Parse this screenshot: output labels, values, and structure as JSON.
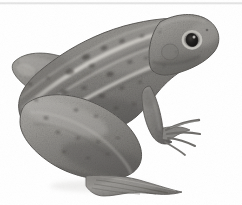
{
  "image": {
    "subject": "frog",
    "caption": "Grayscale photograph of a frog in right-facing profile on a plain white background",
    "orientation": "facing-right",
    "background_color": "#ffffff",
    "width": 242,
    "height": 205,
    "color_mode": "grayscale",
    "top_rule_color": "#c9c9c9"
  },
  "palette": {
    "skin_base": "#8f8d8a",
    "skin_light": "#b4b2ae",
    "skin_mid": "#7e7c79",
    "skin_dark": "#5f5d5a",
    "skin_shadow": "#4a4846",
    "ridge_stripe": "#c3c1bc",
    "spot_dark": "#3a3836",
    "eye_pupil": "#1b1a19",
    "eye_ring": "#cfcdc8",
    "outline": "#55534f",
    "webbing": "#9a9895",
    "highlight": "#d3d1cc"
  },
  "anatomy": {
    "parts": [
      {
        "name": "head",
        "label": "Head"
      },
      {
        "name": "snout",
        "label": "Snout"
      },
      {
        "name": "eye",
        "label": "Eye"
      },
      {
        "name": "tympanum",
        "label": "Tympanum (eardrum)"
      },
      {
        "name": "dorsolateral-ridge",
        "label": "Dorsolateral ridge"
      },
      {
        "name": "back",
        "label": "Back (dorsum)"
      },
      {
        "name": "flank",
        "label": "Flank"
      },
      {
        "name": "foreleg",
        "label": "Foreleg"
      },
      {
        "name": "front-foot",
        "label": "Front foot"
      },
      {
        "name": "thigh",
        "label": "Thigh"
      },
      {
        "name": "shank",
        "label": "Shank (tibia)"
      },
      {
        "name": "hind-foot",
        "label": "Webbed hind foot"
      }
    ]
  },
  "markings": {
    "stripe_count": 3,
    "spot_count": 34,
    "description": "Dark rounded spots scattered over the back and thighs with pale dorsolateral ridges"
  },
  "spots": [
    {
      "cx": 86,
      "cy": 57,
      "rx": 4.0,
      "ry": 2.6,
      "rot": -18,
      "op": 0.55
    },
    {
      "cx": 104,
      "cy": 48,
      "rx": 3.4,
      "ry": 2.2,
      "rot": -20,
      "op": 0.5
    },
    {
      "cx": 122,
      "cy": 41,
      "rx": 3.0,
      "ry": 2.0,
      "rot": -22,
      "op": 0.45
    },
    {
      "cx": 142,
      "cy": 36,
      "rx": 2.6,
      "ry": 1.8,
      "rot": -24,
      "op": 0.42
    },
    {
      "cx": 160,
      "cy": 32,
      "rx": 2.2,
      "ry": 1.5,
      "rot": -25,
      "op": 0.4
    },
    {
      "cx": 70,
      "cy": 72,
      "rx": 4.2,
      "ry": 2.8,
      "rot": -12,
      "op": 0.55
    },
    {
      "cx": 92,
      "cy": 66,
      "rx": 3.2,
      "ry": 2.2,
      "rot": -14,
      "op": 0.45
    },
    {
      "cx": 110,
      "cy": 74,
      "rx": 3.8,
      "ry": 2.5,
      "rot": -10,
      "op": 0.5
    },
    {
      "cx": 130,
      "cy": 62,
      "rx": 2.8,
      "ry": 1.9,
      "rot": -16,
      "op": 0.42
    },
    {
      "cx": 146,
      "cy": 58,
      "rx": 2.4,
      "ry": 1.6,
      "rot": -18,
      "op": 0.38
    },
    {
      "cx": 64,
      "cy": 92,
      "rx": 3.6,
      "ry": 2.4,
      "rot": -6,
      "op": 0.48
    },
    {
      "cx": 84,
      "cy": 88,
      "rx": 2.8,
      "ry": 1.9,
      "rot": -8,
      "op": 0.42
    },
    {
      "cx": 102,
      "cy": 96,
      "rx": 3.2,
      "ry": 2.1,
      "rot": -4,
      "op": 0.45
    },
    {
      "cx": 122,
      "cy": 88,
      "rx": 2.6,
      "ry": 1.8,
      "rot": -10,
      "op": 0.4
    },
    {
      "cx": 140,
      "cy": 82,
      "rx": 2.4,
      "ry": 1.6,
      "rot": -12,
      "op": 0.38
    },
    {
      "cx": 76,
      "cy": 110,
      "rx": 3.0,
      "ry": 2.0,
      "rot": 0,
      "op": 0.42
    },
    {
      "cx": 96,
      "cy": 116,
      "rx": 2.6,
      "ry": 1.8,
      "rot": 2,
      "op": 0.4
    },
    {
      "cx": 116,
      "cy": 108,
      "rx": 2.4,
      "ry": 1.6,
      "rot": -4,
      "op": 0.38
    },
    {
      "cx": 134,
      "cy": 104,
      "rx": 2.2,
      "ry": 1.5,
      "rot": -6,
      "op": 0.36
    },
    {
      "cx": 46,
      "cy": 118,
      "rx": 3.0,
      "ry": 2.0,
      "rot": 8,
      "op": 0.45
    },
    {
      "cx": 58,
      "cy": 132,
      "rx": 2.8,
      "ry": 1.9,
      "rot": 10,
      "op": 0.45
    },
    {
      "cx": 78,
      "cy": 138,
      "rx": 2.6,
      "ry": 1.8,
      "rot": 6,
      "op": 0.42
    },
    {
      "cx": 98,
      "cy": 142,
      "rx": 2.4,
      "ry": 1.6,
      "rot": 4,
      "op": 0.4
    },
    {
      "cx": 118,
      "cy": 138,
      "rx": 2.2,
      "ry": 1.5,
      "rot": 0,
      "op": 0.38
    },
    {
      "cx": 36,
      "cy": 100,
      "rx": 2.6,
      "ry": 1.8,
      "rot": 14,
      "op": 0.44
    },
    {
      "cx": 30,
      "cy": 84,
      "rx": 2.4,
      "ry": 1.6,
      "rot": 20,
      "op": 0.42
    },
    {
      "cx": 48,
      "cy": 78,
      "rx": 2.2,
      "ry": 1.5,
      "rot": 18,
      "op": 0.38
    },
    {
      "cx": 64,
      "cy": 152,
      "rx": 2.6,
      "ry": 1.7,
      "rot": 8,
      "op": 0.4
    },
    {
      "cx": 88,
      "cy": 158,
      "rx": 2.4,
      "ry": 1.6,
      "rot": 6,
      "op": 0.38
    },
    {
      "cx": 108,
      "cy": 154,
      "rx": 2.2,
      "ry": 1.5,
      "rot": 2,
      "op": 0.36
    },
    {
      "cx": 152,
      "cy": 96,
      "rx": 2.0,
      "ry": 1.4,
      "rot": -14,
      "op": 0.34
    },
    {
      "cx": 164,
      "cy": 66,
      "rx": 2.0,
      "ry": 1.4,
      "rot": -20,
      "op": 0.34
    },
    {
      "cx": 176,
      "cy": 52,
      "rx": 1.8,
      "ry": 1.3,
      "rot": -22,
      "op": 0.32
    },
    {
      "cx": 190,
      "cy": 44,
      "rx": 1.6,
      "ry": 1.2,
      "rot": -24,
      "op": 0.3
    }
  ],
  "eye": {
    "cx": 192,
    "cy": 40,
    "pupil_rx": 6.0,
    "pupil_ry": 6.6,
    "ring_rx": 10.5,
    "ring_ry": 10.0,
    "highlight_cx": 194,
    "highlight_cy": 37
  }
}
